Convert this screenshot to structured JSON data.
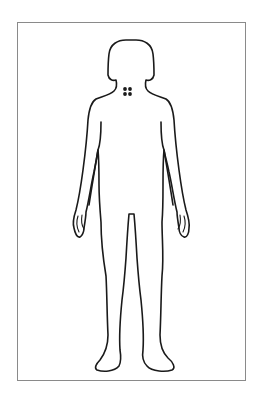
{
  "diagram": {
    "title": "Body map — front view",
    "figure": "female-body-outline-front",
    "frame_color": "#8a8a8a",
    "outline_color": "#1a1a1a",
    "background": "#ffffff"
  },
  "markers": [
    {
      "name": "neck-marker",
      "location": "base of neck / upper back",
      "shape": "four-dot-cluster",
      "color": "#1a1a1a",
      "dots": [
        {
          "x": 125,
          "y": 89
        },
        {
          "x": 130,
          "y": 89
        },
        {
          "x": 125,
          "y": 94
        },
        {
          "x": 130,
          "y": 94
        }
      ]
    }
  ]
}
